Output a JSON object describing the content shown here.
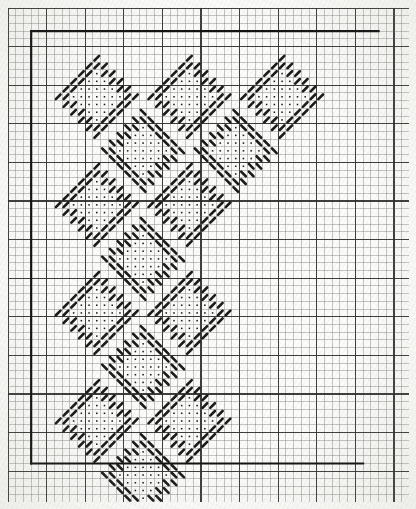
{
  "document": {
    "kind": "needlework-chart",
    "title": "Filet / cross-stitch floral border chart",
    "background_color": "#fcfcfa",
    "ink_color": "#1b1b1b"
  },
  "graph_paper": {
    "cell_px": 7.72,
    "columns": 52,
    "rows": 64,
    "minor_line_color": "#5d5d5d",
    "minor_line_width": 0.55,
    "major_line_color": "#2e2e2e",
    "major_line_width": 1.15,
    "major_every": 5,
    "origin_x": 8,
    "origin_y": 8
  },
  "border_box": {
    "label": "design area border",
    "color": "#111111",
    "stroke_width": 2.2,
    "left_col": 3,
    "top_row": 3,
    "right_col": 48,
    "bottom_row": 59,
    "open_side": "right",
    "segments": [
      {
        "name": "top-rule",
        "from_col": 3,
        "to_col": 48,
        "row": 3
      },
      {
        "name": "left-rule",
        "col": 3,
        "from_row": 3,
        "to_row": 59
      },
      {
        "name": "bottom-rule",
        "from_col": 3,
        "to_col": 46,
        "row": 59
      }
    ]
  },
  "symbols": {
    "slash": {
      "name": "slash-stitch",
      "glyph": "/",
      "color": "#101010"
    },
    "backslash": {
      "name": "backslash-stitch",
      "glyph": "\\",
      "color": "#101010"
    },
    "dot": {
      "name": "dot-stitch",
      "glyph": "·",
      "color": "#101010"
    }
  },
  "motifs": [
    {
      "id": "m1",
      "type": "slash",
      "name": "flower-slash-top-left",
      "col": 6,
      "row": 6
    },
    {
      "id": "m2",
      "type": "slash",
      "name": "flower-slash-top-center",
      "col": 18,
      "row": 6
    },
    {
      "id": "m3",
      "type": "slash",
      "name": "flower-slash-top-right",
      "col": 30,
      "row": 6
    },
    {
      "id": "m4",
      "type": "backslash",
      "name": "flower-back-row2-left",
      "col": 12,
      "row": 13
    },
    {
      "id": "m5",
      "type": "backslash",
      "name": "flower-back-row2-right",
      "col": 24,
      "row": 13
    },
    {
      "id": "m6",
      "type": "slash",
      "name": "flower-slash-row3-left",
      "col": 6,
      "row": 20
    },
    {
      "id": "m7",
      "type": "slash",
      "name": "flower-slash-row3-right",
      "col": 18,
      "row": 20
    },
    {
      "id": "m8",
      "type": "backslash",
      "name": "flower-back-row4",
      "col": 12,
      "row": 27
    },
    {
      "id": "m9",
      "type": "slash",
      "name": "flower-slash-row5-left",
      "col": 6,
      "row": 34
    },
    {
      "id": "m10",
      "type": "slash",
      "name": "flower-slash-row5-right",
      "col": 18,
      "row": 34
    },
    {
      "id": "m11",
      "type": "backslash",
      "name": "flower-back-row6",
      "col": 12,
      "row": 41
    },
    {
      "id": "m12",
      "type": "slash",
      "name": "flower-slash-row7-left",
      "col": 6,
      "row": 48
    },
    {
      "id": "m13",
      "type": "slash",
      "name": "flower-slash-row7-right",
      "col": 18,
      "row": 48
    },
    {
      "id": "m14",
      "type": "backslash",
      "name": "flower-back-row8",
      "col": 12,
      "row": 55
    }
  ],
  "motif_template": {
    "width": 11,
    "height": 11,
    "description": "Diamond flower: outline ring of diagonal stitches with inner field of dots",
    "diagonal_cells": [
      [
        5,
        0
      ],
      [
        4,
        1
      ],
      [
        5,
        1
      ],
      [
        6,
        1
      ],
      [
        3,
        2
      ],
      [
        4,
        2
      ],
      [
        6,
        2
      ],
      [
        7,
        2
      ],
      [
        2,
        3
      ],
      [
        3,
        3
      ],
      [
        7,
        3
      ],
      [
        8,
        3
      ],
      [
        1,
        4
      ],
      [
        2,
        4
      ],
      [
        8,
        4
      ],
      [
        9,
        4
      ],
      [
        0,
        5
      ],
      [
        1,
        5
      ],
      [
        9,
        5
      ],
      [
        10,
        5
      ],
      [
        1,
        6
      ],
      [
        2,
        6
      ],
      [
        8,
        6
      ],
      [
        9,
        6
      ],
      [
        2,
        7
      ],
      [
        3,
        7
      ],
      [
        7,
        7
      ],
      [
        8,
        7
      ],
      [
        3,
        8
      ],
      [
        4,
        8
      ],
      [
        6,
        8
      ],
      [
        7,
        8
      ],
      [
        4,
        9
      ],
      [
        5,
        9
      ],
      [
        6,
        9
      ],
      [
        5,
        10
      ]
    ],
    "dot_cells": [
      [
        5,
        2
      ],
      [
        4,
        3
      ],
      [
        5,
        3
      ],
      [
        6,
        3
      ],
      [
        3,
        4
      ],
      [
        4,
        4
      ],
      [
        5,
        4
      ],
      [
        6,
        4
      ],
      [
        7,
        4
      ],
      [
        2,
        5
      ],
      [
        3,
        5
      ],
      [
        4,
        5
      ],
      [
        5,
        5
      ],
      [
        6,
        5
      ],
      [
        7,
        5
      ],
      [
        8,
        5
      ],
      [
        3,
        6
      ],
      [
        4,
        6
      ],
      [
        5,
        6
      ],
      [
        6,
        6
      ],
      [
        7,
        6
      ],
      [
        4,
        7
      ],
      [
        5,
        7
      ],
      [
        6,
        7
      ],
      [
        5,
        8
      ]
    ]
  }
}
